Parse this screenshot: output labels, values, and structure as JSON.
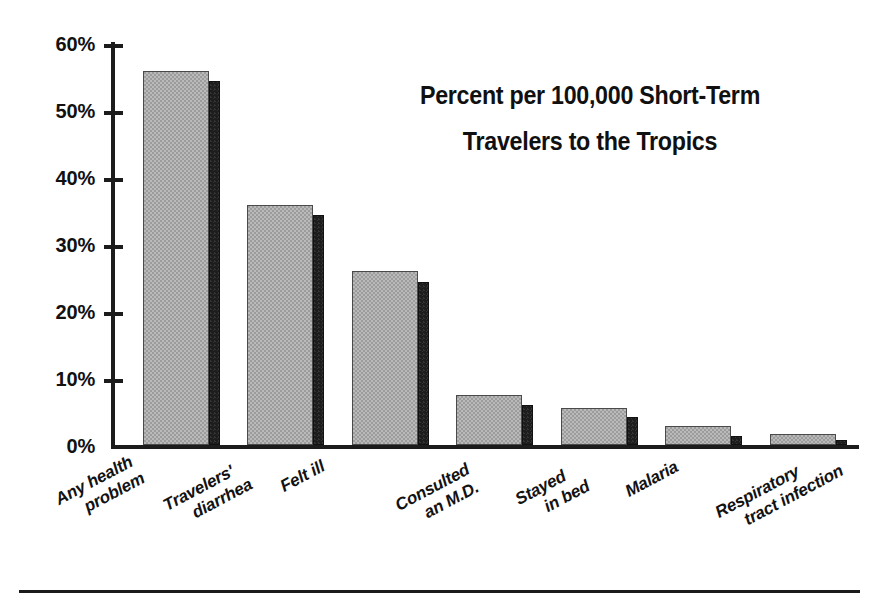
{
  "chart_data": {
    "type": "bar",
    "title": "Percent per 100,000 Short-Term Travelers to the Tropics",
    "title_lines": [
      "Percent per 100,000 Short-Term",
      "Travelers to the Tropics"
    ],
    "xlabel": "",
    "ylabel": "",
    "ylim": [
      0,
      60
    ],
    "grid": false,
    "legend": "none",
    "y_tick_labels": [
      "60%",
      "50%",
      "40%",
      "30%",
      "20%",
      "10%",
      "0%"
    ],
    "y_tick_values": [
      60,
      50,
      40,
      30,
      20,
      10,
      0
    ],
    "categories": [
      "Any health problem",
      "Travelers' diarrhea",
      "Felt ill",
      "Consulted an M.D.",
      "Stayed in bed",
      "Malaria",
      "Respiratory tract infection"
    ],
    "category_label_lines": [
      [
        "Any health",
        "problem"
      ],
      [
        "Travelers'",
        "diarrhea"
      ],
      [
        "Felt ill"
      ],
      [
        "Consulted",
        "an M.D."
      ],
      [
        "Stayed",
        "in bed"
      ],
      [
        "Malaria"
      ],
      [
        "Respiratory",
        "tract infection"
      ]
    ],
    "series": [
      {
        "name": "gray",
        "color": "#9c9c9c",
        "values": [
          55.7,
          35.7,
          25.9,
          7.4,
          5.5,
          2.9,
          1.7
        ]
      },
      {
        "name": "dark",
        "color": "#1d1d1d",
        "values": [
          54.2,
          34.2,
          24.3,
          5.9,
          4.1,
          1.4,
          0.8
        ]
      }
    ]
  },
  "colors": {
    "bar_gray": "#9c9c9c",
    "bar_dark": "#1d1d1d",
    "axis": "#1c1c1c",
    "text": "#111111",
    "background": "#ffffff"
  }
}
